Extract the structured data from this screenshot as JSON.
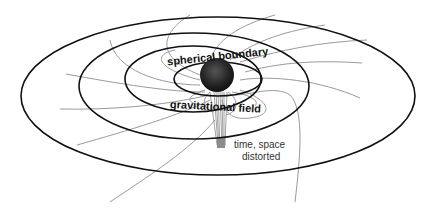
{
  "diagram": {
    "labels": {
      "top": "spherical boundary",
      "middle": "gravitational field",
      "bottom_line1": "time, space",
      "bottom_line2": "distorted"
    },
    "colors": {
      "ellipse": "#111111",
      "field_line": "#9a9a9a",
      "sphere": "#2a2a2a",
      "stem": "#8c8c8c"
    }
  }
}
